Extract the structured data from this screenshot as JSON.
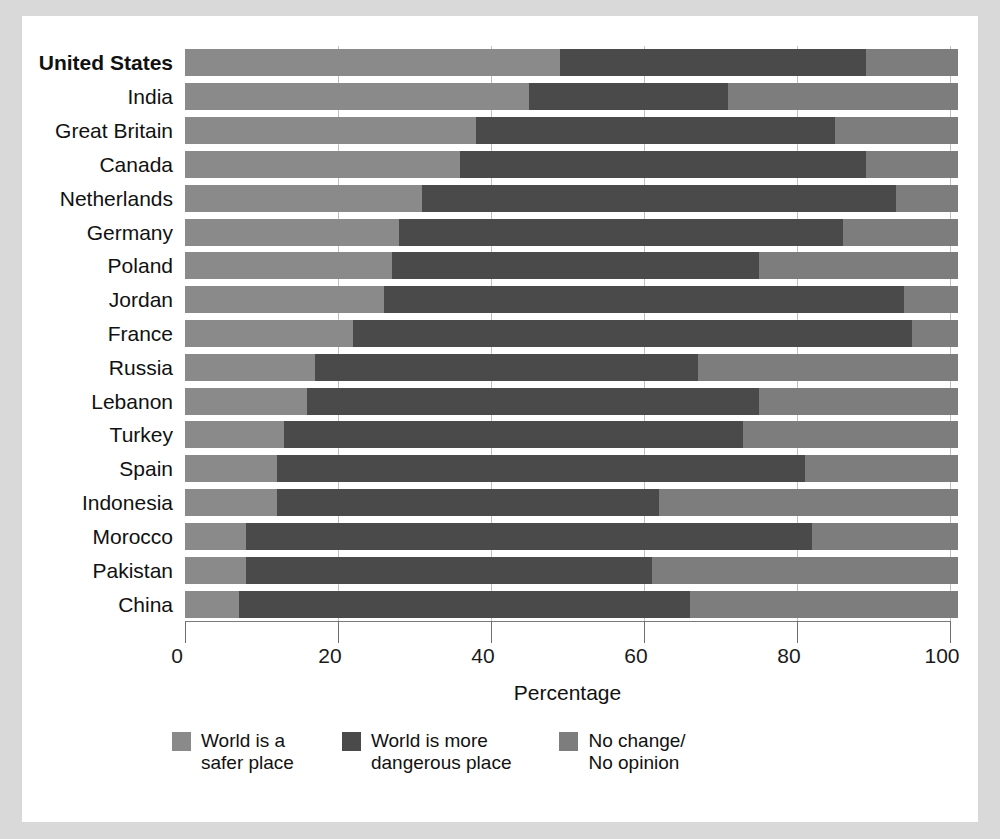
{
  "chart_data": {
    "type": "bar",
    "orientation": "horizontal",
    "stacked": true,
    "title": "",
    "xlabel": "Percentage",
    "ylabel": "",
    "xlim": [
      0,
      100
    ],
    "xticks": [
      0,
      20,
      40,
      60,
      80,
      100
    ],
    "grid": true,
    "legend_position": "bottom",
    "highlight_category": "United States",
    "categories": [
      "United States",
      "India",
      "Great Britain",
      "Canada",
      "Netherlands",
      "Germany",
      "Poland",
      "Jordan",
      "France",
      "Russia",
      "Lebanon",
      "Turkey",
      "Spain",
      "Indonesia",
      "Morocco",
      "Pakistan",
      "China"
    ],
    "series": [
      {
        "name": "World is a safer place",
        "color": "#8a8a8a",
        "values": [
          49,
          45,
          38,
          36,
          31,
          28,
          27,
          26,
          22,
          17,
          16,
          13,
          12,
          12,
          8,
          8,
          7
        ]
      },
      {
        "name": "World is more dangerous place",
        "color": "#4a4a4a",
        "values": [
          40,
          26,
          47,
          53,
          62,
          58,
          48,
          68,
          73,
          50,
          59,
          60,
          69,
          50,
          74,
          53,
          59
        ]
      },
      {
        "name": "No change/No opinion",
        "color": "#7d7d7d",
        "values": [
          12,
          30,
          16,
          12,
          8,
          15,
          26,
          7,
          6,
          34,
          26,
          28,
          20,
          39,
          19,
          40,
          35
        ]
      }
    ]
  },
  "axis": {
    "tick_labels": [
      "0",
      "20",
      "40",
      "60",
      "80",
      "100"
    ],
    "x_axis_title": "Percentage"
  },
  "legend": {
    "items": [
      {
        "label": "World is a\nsafer place",
        "color": "#8a8a8a",
        "key": "safer"
      },
      {
        "label": "World is more\ndangerous place",
        "color": "#4a4a4a",
        "key": "danger"
      },
      {
        "label": "No change/\nNo opinion",
        "color": "#7d7d7d",
        "key": "nochange"
      }
    ]
  },
  "colors": {
    "safer": "#8a8a8a",
    "danger": "#4a4a4a",
    "nochange": "#7d7d7d",
    "page_background": "#d9d9d9",
    "card_background": "#ffffff",
    "gridline": "#bfbfbf",
    "text": "#111111"
  }
}
